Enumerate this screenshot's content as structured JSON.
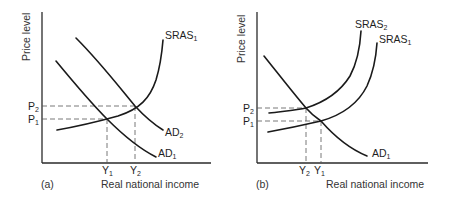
{
  "panels": [
    {
      "id": "a",
      "panel_label": "(a)",
      "y_axis_label": "Price level",
      "x_axis_label": "Real national income",
      "price_levels": [
        {
          "label": "P",
          "sub": "2"
        },
        {
          "label": "P",
          "sub": "1"
        }
      ],
      "incomes": [
        {
          "label": "Y",
          "sub": "1"
        },
        {
          "label": "Y",
          "sub": "2"
        }
      ],
      "curves": [
        {
          "label": "SRAS",
          "sub": "1"
        },
        {
          "label": "AD",
          "sub": "2"
        },
        {
          "label": "AD",
          "sub": "1"
        }
      ]
    },
    {
      "id": "b",
      "panel_label": "(b)",
      "y_axis_label": "Price level",
      "x_axis_label": "Real national income",
      "price_levels": [
        {
          "label": "P",
          "sub": "2"
        },
        {
          "label": "P",
          "sub": "1"
        }
      ],
      "incomes": [
        {
          "label": "Y",
          "sub": "2"
        },
        {
          "label": "Y",
          "sub": "1"
        }
      ],
      "curves": [
        {
          "label": "SRAS",
          "sub": "2"
        },
        {
          "label": "SRAS",
          "sub": "1"
        },
        {
          "label": "AD",
          "sub": "1"
        }
      ]
    }
  ]
}
